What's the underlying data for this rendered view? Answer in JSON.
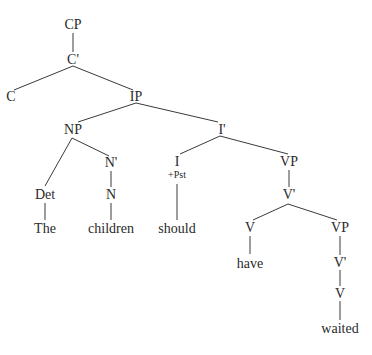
{
  "diagram": {
    "type": "syntax-tree",
    "line_color": "#3a3a3a",
    "text_color": "#2a2a2a",
    "nodes": [
      {
        "id": "cp",
        "label": "CP",
        "x": 73,
        "y": 25
      },
      {
        "id": "cbar",
        "label": "C'",
        "x": 73,
        "y": 60
      },
      {
        "id": "c",
        "label": "C",
        "x": 11,
        "y": 97
      },
      {
        "id": "ip",
        "label": "IP",
        "x": 136,
        "y": 97
      },
      {
        "id": "np",
        "label": "NP",
        "x": 73,
        "y": 130
      },
      {
        "id": "ibar",
        "label": "I'",
        "x": 222,
        "y": 130
      },
      {
        "id": "det",
        "label": "Det",
        "x": 45,
        "y": 195
      },
      {
        "id": "nbar",
        "label": "N'",
        "x": 111,
        "y": 163
      },
      {
        "id": "n",
        "label": "N",
        "x": 111,
        "y": 195
      },
      {
        "id": "i",
        "label": "I",
        "x": 177,
        "y": 162
      },
      {
        "id": "vp1",
        "label": "VP",
        "x": 289,
        "y": 162
      },
      {
        "id": "vbar1",
        "label": "V'",
        "x": 289,
        "y": 195
      },
      {
        "id": "the",
        "label": "The",
        "x": 45,
        "y": 229
      },
      {
        "id": "children",
        "label": "children",
        "x": 111,
        "y": 229
      },
      {
        "id": "should",
        "label": "should",
        "x": 177,
        "y": 229
      },
      {
        "id": "v1",
        "label": "V",
        "x": 250,
        "y": 228
      },
      {
        "id": "vp2",
        "label": "VP",
        "x": 340,
        "y": 228
      },
      {
        "id": "have",
        "label": "have",
        "x": 250,
        "y": 264
      },
      {
        "id": "vbar2",
        "label": "V'",
        "x": 340,
        "y": 263
      },
      {
        "id": "v2",
        "label": "V",
        "x": 340,
        "y": 294
      },
      {
        "id": "waited",
        "label": "waited",
        "x": 340,
        "y": 329
      }
    ],
    "features": [
      {
        "id": "i_feature",
        "label": "+Pst",
        "x": 177,
        "y": 175
      }
    ],
    "edges": [
      {
        "from": "cp",
        "to": "cbar",
        "x1": 73,
        "y1": 33,
        "x2": 73,
        "y2": 52
      },
      {
        "from": "cbar",
        "to": "c",
        "x1": 73,
        "y1": 66,
        "x2": 14,
        "y2": 90
      },
      {
        "from": "cbar",
        "to": "ip",
        "x1": 73,
        "y1": 66,
        "x2": 133,
        "y2": 90
      },
      {
        "from": "ip",
        "to": "np",
        "x1": 136,
        "y1": 103,
        "x2": 78,
        "y2": 122
      },
      {
        "from": "ip",
        "to": "ibar",
        "x1": 136,
        "y1": 103,
        "x2": 218,
        "y2": 122
      },
      {
        "from": "np",
        "to": "det",
        "x1": 72,
        "y1": 138,
        "x2": 45,
        "y2": 186
      },
      {
        "from": "np",
        "to": "nbar",
        "x1": 72,
        "y1": 138,
        "x2": 109,
        "y2": 156
      },
      {
        "from": "nbar",
        "to": "n",
        "x1": 111,
        "y1": 171,
        "x2": 111,
        "y2": 187
      },
      {
        "from": "det",
        "to": "the",
        "x1": 45,
        "y1": 203,
        "x2": 45,
        "y2": 220
      },
      {
        "from": "n",
        "to": "children",
        "x1": 111,
        "y1": 203,
        "x2": 111,
        "y2": 220
      },
      {
        "from": "ibar",
        "to": "i",
        "x1": 220,
        "y1": 136,
        "x2": 180,
        "y2": 154
      },
      {
        "from": "ibar",
        "to": "vp1",
        "x1": 220,
        "y1": 136,
        "x2": 288,
        "y2": 154
      },
      {
        "from": "i",
        "to": "should",
        "x1": 177,
        "y1": 184,
        "x2": 177,
        "y2": 220
      },
      {
        "from": "vp1",
        "to": "vbar1",
        "x1": 289,
        "y1": 170,
        "x2": 289,
        "y2": 187
      },
      {
        "from": "vbar1",
        "to": "v1",
        "x1": 288,
        "y1": 204,
        "x2": 253,
        "y2": 220
      },
      {
        "from": "vbar1",
        "to": "vp2",
        "x1": 288,
        "y1": 204,
        "x2": 337,
        "y2": 220
      },
      {
        "from": "v1",
        "to": "have",
        "x1": 250,
        "y1": 236,
        "x2": 250,
        "y2": 254
      },
      {
        "from": "vp2",
        "to": "vbar2",
        "x1": 340,
        "y1": 236,
        "x2": 340,
        "y2": 255
      },
      {
        "from": "vbar2",
        "to": "v2",
        "x1": 340,
        "y1": 270,
        "x2": 340,
        "y2": 286
      },
      {
        "from": "v2",
        "to": "waited",
        "x1": 340,
        "y1": 301,
        "x2": 340,
        "y2": 320
      }
    ]
  }
}
